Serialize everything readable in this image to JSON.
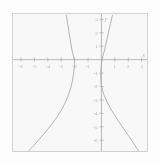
{
  "figure": {
    "background_color": "#ffffff",
    "frame_color": "#b6b6b6",
    "curve_color": "#767676",
    "axis_color": "#6e6e6e",
    "label_color": "#6a6a6a"
  },
  "chart_data": {
    "type": "line",
    "title": "",
    "subtitle": "",
    "xlabel": "x",
    "ylabel": "y",
    "grid": false,
    "legend": "none",
    "xlim": [
      -6.6,
      3.4
    ],
    "ylim": [
      -6.8,
      3.4
    ],
    "xticks": [
      -6,
      -5,
      -4,
      -3,
      -2,
      -1,
      1,
      2,
      3
    ],
    "yticks": [
      3,
      2,
      1,
      -1,
      -2,
      -3,
      -4,
      -5,
      -6
    ],
    "xtick_labels": [
      "-6",
      "-5",
      "-4",
      "-3",
      "-2",
      "-1",
      "1",
      "2",
      "3"
    ],
    "ytick_labels": [
      "3",
      "2",
      "1",
      "-1",
      "-2",
      "-3",
      "-4",
      "-5",
      "-6"
    ],
    "annotations": [],
    "series": [
      {
        "name": "left-branch",
        "comment": "branch passing through vertex near (-2, 0), opening up-left and down-left",
        "points": [
          [
            -2.62,
            3.3
          ],
          [
            -2.52,
            2.7
          ],
          [
            -2.43,
            2.1
          ],
          [
            -2.34,
            1.55
          ],
          [
            -2.26,
            1.05
          ],
          [
            -2.18,
            0.62
          ],
          [
            -2.1,
            0.28
          ],
          [
            -2.04,
            0.05
          ],
          [
            -2.0,
            -0.12
          ],
          [
            -2.02,
            -0.55
          ],
          [
            -2.08,
            -1.05
          ],
          [
            -2.16,
            -1.55
          ],
          [
            -2.28,
            -2.05
          ],
          [
            -2.45,
            -2.6
          ],
          [
            -2.68,
            -3.15
          ],
          [
            -2.96,
            -3.7
          ],
          [
            -3.3,
            -4.25
          ],
          [
            -3.7,
            -4.8
          ],
          [
            -4.15,
            -5.35
          ],
          [
            -4.62,
            -5.9
          ],
          [
            -5.1,
            -6.45
          ],
          [
            -5.45,
            -6.82
          ]
        ]
      },
      {
        "name": "right-branch",
        "comment": "branch passing near the origin, opening up-right and down-right",
        "points": [
          [
            0.82,
            3.3
          ],
          [
            0.68,
            2.7
          ],
          [
            0.55,
            2.15
          ],
          [
            0.44,
            1.62
          ],
          [
            0.33,
            1.15
          ],
          [
            0.23,
            0.72
          ],
          [
            0.14,
            0.36
          ],
          [
            0.07,
            0.08
          ],
          [
            0.02,
            -0.18
          ],
          [
            -0.02,
            -0.55
          ],
          [
            -0.05,
            -0.95
          ],
          [
            -0.05,
            -1.4
          ],
          [
            -0.02,
            -1.8
          ],
          [
            0.06,
            -2.2
          ],
          [
            0.2,
            -2.65
          ],
          [
            0.4,
            -3.1
          ],
          [
            0.66,
            -3.6
          ],
          [
            0.96,
            -4.1
          ],
          [
            1.3,
            -4.62
          ],
          [
            1.66,
            -5.15
          ],
          [
            2.04,
            -5.7
          ],
          [
            2.42,
            -6.25
          ],
          [
            2.76,
            -6.78
          ]
        ]
      }
    ]
  }
}
